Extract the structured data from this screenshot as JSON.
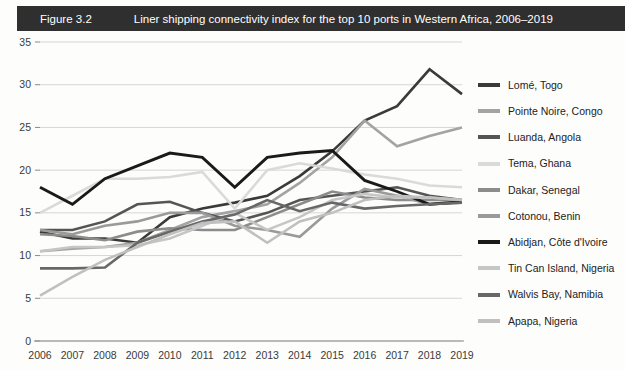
{
  "figure": {
    "number": "Figure 3.2",
    "title": "Liner shipping connectivity index for the top 10 ports in Western Africa, 2006–2019",
    "header_bg": "#2f2f2f",
    "header_text_color": "#ffffff"
  },
  "chart_data": {
    "type": "line",
    "title": "Liner shipping connectivity index for the top 10 ports in Western Africa, 2006–2019",
    "xlabel": "",
    "ylabel": "",
    "x": [
      2006,
      2007,
      2008,
      2009,
      2010,
      2011,
      2012,
      2013,
      2014,
      2015,
      2016,
      2017,
      2018,
      2019
    ],
    "categories": [
      "2006",
      "2007",
      "2008",
      "2009",
      "2010",
      "2011",
      "2012",
      "2013",
      "2014",
      "2015",
      "2016",
      "2017",
      "2018",
      "2019"
    ],
    "ylim": [
      0,
      35
    ],
    "yticks": [
      0,
      5,
      10,
      15,
      20,
      25,
      30,
      35
    ],
    "ytick_labels": [
      "0",
      "5",
      "10",
      "15",
      "20",
      "25",
      "30",
      "35"
    ],
    "grid": true,
    "legend_position": "right",
    "series": [
      {
        "name": "Lomé, Togo",
        "color": "#3a3a3a",
        "width": 2.6,
        "values": [
          12.8,
          12.0,
          12.0,
          11.5,
          14.5,
          15.5,
          16.2,
          17.0,
          19.3,
          22.2,
          25.8,
          27.5,
          31.8,
          28.9
        ]
      },
      {
        "name": "Pointe Noire, Congo",
        "color": "#a3a3a3",
        "width": 2.6,
        "values": [
          10.5,
          10.8,
          11.0,
          11.5,
          13.0,
          14.5,
          15.2,
          16.0,
          18.5,
          21.5,
          25.8,
          22.8,
          24.0,
          25.0
        ]
      },
      {
        "name": "Luanda, Angola",
        "color": "#555555",
        "width": 2.6,
        "values": [
          13.0,
          13.0,
          14.0,
          16.0,
          16.3,
          15.0,
          14.0,
          15.0,
          16.5,
          17.0,
          17.5,
          18.0,
          17.0,
          16.5
        ]
      },
      {
        "name": "Tema, Ghana",
        "color": "#dadada",
        "width": 2.6,
        "values": [
          15.0,
          17.0,
          19.0,
          19.0,
          19.2,
          19.8,
          15.5,
          20.0,
          20.8,
          20.2,
          19.5,
          19.0,
          18.2,
          18.0
        ]
      },
      {
        "name": "Dakar, Senegal",
        "color": "#8c8c8c",
        "width": 2.6,
        "values": [
          12.5,
          12.3,
          11.8,
          12.8,
          13.2,
          13.0,
          13.0,
          14.5,
          16.0,
          17.5,
          16.8,
          16.5,
          16.5,
          16.5
        ]
      },
      {
        "name": "Cotonou, Benin",
        "color": "#9a9a9a",
        "width": 2.6,
        "values": [
          13.0,
          12.5,
          13.5,
          14.0,
          15.0,
          15.0,
          13.5,
          13.0,
          12.2,
          15.5,
          17.8,
          17.0,
          16.0,
          16.2
        ]
      },
      {
        "name": "Abidjan, Côte d'Ivoire",
        "color": "#1a1a1a",
        "width": 2.9,
        "values": [
          18.0,
          16.0,
          19.0,
          20.5,
          22.0,
          21.5,
          18.0,
          21.5,
          22.0,
          22.3,
          18.8,
          17.5,
          16.0,
          16.3
        ]
      },
      {
        "name": "Tin Can Island, Nigeria",
        "color": "#c6c6c6",
        "width": 2.6,
        "values": [
          10.5,
          11.0,
          11.0,
          11.2,
          12.0,
          13.5,
          15.0,
          13.0,
          14.5,
          16.5,
          17.2,
          16.8,
          16.8,
          16.5
        ]
      },
      {
        "name": "Walvis Bay, Namibia",
        "color": "#686868",
        "width": 2.6,
        "values": [
          8.5,
          8.5,
          8.6,
          11.5,
          12.8,
          14.0,
          14.8,
          16.5,
          15.2,
          16.2,
          15.5,
          15.8,
          16.0,
          16.2
        ]
      },
      {
        "name": "Apapa, Nigeria",
        "color": "#c0c0c0",
        "width": 2.6,
        "values": [
          5.3,
          7.5,
          9.5,
          11.0,
          12.5,
          13.8,
          14.0,
          11.5,
          14.0,
          15.0,
          16.5,
          17.0,
          16.8,
          16.5
        ]
      }
    ]
  }
}
